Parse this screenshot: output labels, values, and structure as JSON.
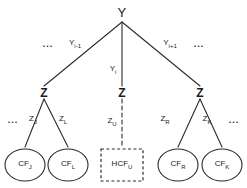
{
  "diagram": {
    "stroke_color": "#2b2b2b",
    "background_color": "#ffffff",
    "root": {
      "label": "Y",
      "name": "root-node-y"
    },
    "root_edges": [
      {
        "label": "Y",
        "sub": "i-1",
        "style": "solid",
        "name": "edge-label-y-i-minus-1"
      },
      {
        "label": "Y",
        "sub": "i",
        "style": "solid",
        "name": "edge-label-y-i"
      },
      {
        "label": "Y",
        "sub": "i+1",
        "style": "solid",
        "name": "edge-label-y-i-plus-1"
      }
    ],
    "mid_nodes": [
      {
        "label": "Z",
        "name": "mid-node-z-left"
      },
      {
        "label": "Z",
        "name": "mid-node-z-center"
      },
      {
        "label": "Z",
        "name": "mid-node-z-right"
      }
    ],
    "mid_edges": [
      {
        "label": "Z",
        "sub": "J",
        "style": "solid",
        "name": "edge-label-z-j"
      },
      {
        "label": "Z",
        "sub": "L",
        "style": "solid",
        "name": "edge-label-z-l"
      },
      {
        "label": "Z",
        "sub": "U",
        "style": "dashed",
        "name": "edge-label-z-u"
      },
      {
        "label": "Z",
        "sub": "R",
        "style": "solid",
        "name": "edge-label-z-r"
      },
      {
        "label": "Z",
        "sub": "K",
        "style": "solid",
        "name": "edge-label-z-k"
      }
    ],
    "leaves": [
      {
        "label": "CF",
        "sub": "J",
        "shape": "ellipse",
        "name": "leaf-node-cf-j"
      },
      {
        "label": "CF",
        "sub": "L",
        "shape": "ellipse",
        "name": "leaf-node-cf-l"
      },
      {
        "label": "HCF",
        "sub": "U",
        "shape": "dashed-rectangle",
        "name": "leaf-node-hcf-u"
      },
      {
        "label": "CF",
        "sub": "R",
        "shape": "ellipse",
        "name": "leaf-node-cf-r"
      },
      {
        "label": "CF",
        "sub": "K",
        "shape": "ellipse",
        "name": "leaf-node-cf-k"
      }
    ],
    "ellipses_text": {
      "top_left": "...",
      "top_right": "...",
      "bottom_left": "...",
      "bottom_right": "..."
    }
  }
}
